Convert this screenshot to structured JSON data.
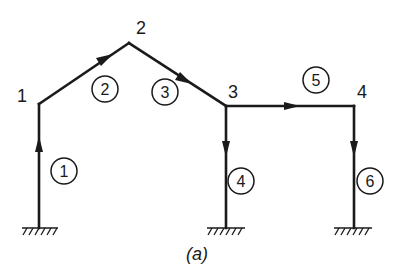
{
  "diagram": {
    "caption": "(a)",
    "nodes": [
      {
        "id": "1",
        "label": "1"
      },
      {
        "id": "2",
        "label": "2"
      },
      {
        "id": "3",
        "label": "3"
      },
      {
        "id": "4",
        "label": "4"
      }
    ],
    "members": [
      {
        "id": "1",
        "label": "1",
        "from": "support-A",
        "to": "node-1",
        "direction": "up"
      },
      {
        "id": "2",
        "label": "2",
        "from": "node-1",
        "to": "node-2",
        "direction": "toward node 2"
      },
      {
        "id": "3",
        "label": "3",
        "from": "node-2",
        "to": "node-3",
        "direction": "toward node 3"
      },
      {
        "id": "4",
        "label": "4",
        "from": "node-3",
        "to": "support-B",
        "direction": "down"
      },
      {
        "id": "5",
        "label": "5",
        "from": "node-3",
        "to": "node-4",
        "direction": "right"
      },
      {
        "id": "6",
        "label": "6",
        "from": "node-4",
        "to": "support-C",
        "direction": "down"
      }
    ],
    "supports": [
      {
        "id": "A",
        "type": "fixed"
      },
      {
        "id": "B",
        "type": "fixed"
      },
      {
        "id": "C",
        "type": "fixed"
      }
    ]
  }
}
